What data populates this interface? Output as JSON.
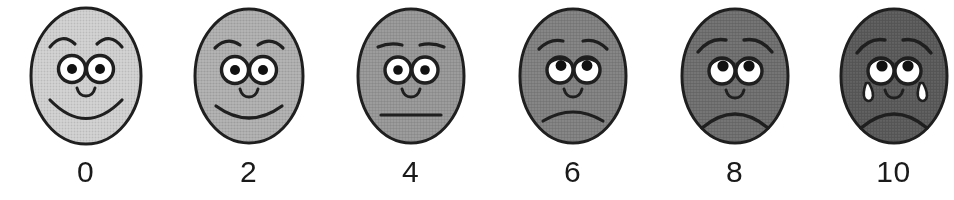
{
  "scale": {
    "name": "Wong-Baker FACES Pain Rating Scale",
    "type": "faces-pain-rating-scale",
    "background_color": "#ffffff",
    "ink_color": "#1a1a1a",
    "label_count": 6,
    "faces": [
      {
        "value": "0",
        "label": "0",
        "expression": "smiling",
        "fill_color": "#d4d4d4",
        "brow": "raised-arched",
        "eye_style": "round-open",
        "pupil_position": "center",
        "mouth": "big-smile",
        "tears": 0,
        "center_x": 86
      },
      {
        "value": "2",
        "label": "2",
        "expression": "slight-smile",
        "fill_color": "#b6b6b6",
        "brow": "gently-arched",
        "eye_style": "round-open",
        "pupil_position": "center",
        "mouth": "smile",
        "tears": 0,
        "center_x": 249
      },
      {
        "value": "4",
        "label": "4",
        "expression": "neutral",
        "fill_color": "#a3a3a3",
        "brow": "flat",
        "eye_style": "round-open",
        "pupil_position": "center",
        "mouth": "straight-line",
        "tears": 0,
        "center_x": 411
      },
      {
        "value": "6",
        "label": "6",
        "expression": "slight-frown",
        "fill_color": "#8e8e8e",
        "brow": "worried",
        "eye_style": "droopy",
        "pupil_position": "upper",
        "mouth": "frown",
        "tears": 0,
        "center_x": 573
      },
      {
        "value": "8",
        "label": "8",
        "expression": "sad",
        "fill_color": "#7d7d7d",
        "brow": "very-worried",
        "eye_style": "droopy-lidded",
        "pupil_position": "upper",
        "mouth": "deep-frown",
        "tears": 0,
        "center_x": 735
      },
      {
        "value": "10",
        "label": "10",
        "expression": "crying",
        "fill_color": "#6b6b6b",
        "brow": "very-worried",
        "eye_style": "droopy-lidded",
        "pupil_position": "upper",
        "mouth": "deep-frown",
        "tears": 2,
        "center_x": 893
      }
    ]
  }
}
